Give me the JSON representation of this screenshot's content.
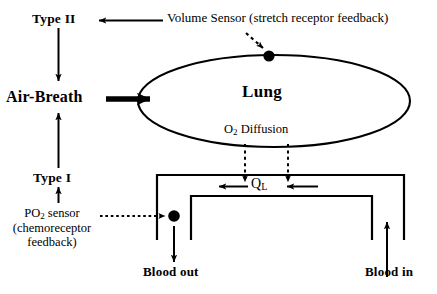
{
  "diagram": {
    "background_color": "#ffffff",
    "stroke_color": "#000000",
    "labels": {
      "type_ii": "Type II",
      "type_i": "Type I",
      "air_breath": "Air-Breath",
      "lung": "Lung",
      "o2_diffusion_pre": "O",
      "o2_diffusion_sub": "2",
      "o2_diffusion_post": " Diffusion",
      "volume_sensor": "Volume Sensor (stretch receptor feedback)",
      "po2_sensor_line1_pre": "PO",
      "po2_sensor_line1_sub": "2",
      "po2_sensor_line1_post": " sensor",
      "po2_sensor_line2": "(chemoreceptor",
      "po2_sensor_line3": "feedback)",
      "ql_pre": "Q",
      "ql_sub": "L",
      "blood_out": "Blood out",
      "blood_in": "Blood in"
    },
    "nodes": [
      {
        "name": "volume-sensor-node",
        "x": 269,
        "y": 56,
        "r": 5.5,
        "fill": "#000000"
      },
      {
        "name": "po2-sensor-node",
        "x": 174,
        "y": 216,
        "r": 5.5,
        "fill": "#000000"
      }
    ],
    "connectors": [
      {
        "name": "volume-sensor-to-type-ii",
        "style": "solid",
        "direction": "left"
      },
      {
        "name": "volume-sensor-to-lung",
        "style": "dotted",
        "direction": "down-right"
      },
      {
        "name": "type-ii-to-air-breath",
        "style": "solid",
        "direction": "down"
      },
      {
        "name": "air-breath-to-lung",
        "style": "solid-thick",
        "direction": "right"
      },
      {
        "name": "type-i-to-air-breath",
        "style": "solid",
        "direction": "up"
      },
      {
        "name": "po2-sensor-to-type-i",
        "style": "solid",
        "direction": "up"
      },
      {
        "name": "po2-sensor-to-blood-node",
        "style": "dotted",
        "direction": "right"
      },
      {
        "name": "o2-diffusion-left",
        "style": "dotted",
        "direction": "down"
      },
      {
        "name": "o2-diffusion-right",
        "style": "dotted",
        "direction": "down"
      },
      {
        "name": "ql-flow-left",
        "style": "solid",
        "direction": "left"
      },
      {
        "name": "ql-flow-right",
        "style": "solid",
        "direction": "left"
      },
      {
        "name": "blood-out-flow",
        "style": "solid",
        "direction": "down"
      },
      {
        "name": "blood-in-flow",
        "style": "solid",
        "direction": "up"
      }
    ]
  }
}
